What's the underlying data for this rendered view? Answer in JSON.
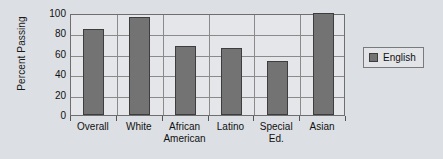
{
  "chart_data": {
    "type": "bar",
    "title": "",
    "xlabel": "",
    "ylabel": "Percent Passing",
    "categories": [
      "Overall",
      "White",
      "African American",
      "Latino",
      "Special Ed.",
      "Asian"
    ],
    "series": [
      {
        "name": "English",
        "values": [
          84,
          96,
          68,
          66,
          53,
          100
        ]
      }
    ],
    "ylim": [
      0,
      100
    ],
    "yticks": [
      0,
      20,
      40,
      60,
      80,
      100
    ],
    "ytick_labels": [
      "0",
      "20",
      "40",
      "60",
      "80",
      "100"
    ],
    "grid": true,
    "legend_position": "right",
    "colors": {
      "bar": "#737373",
      "bar_edge": "#3d3d3d",
      "plot_background": "#e4e6e9",
      "figure_background": "#dcdfe3",
      "gridline": "#8a8a8a",
      "frame": "#6e6e6e",
      "text": "#111111"
    }
  },
  "legend": {
    "entries": [
      {
        "label": "English",
        "swatch_name": "legend-swatch-english"
      }
    ]
  }
}
